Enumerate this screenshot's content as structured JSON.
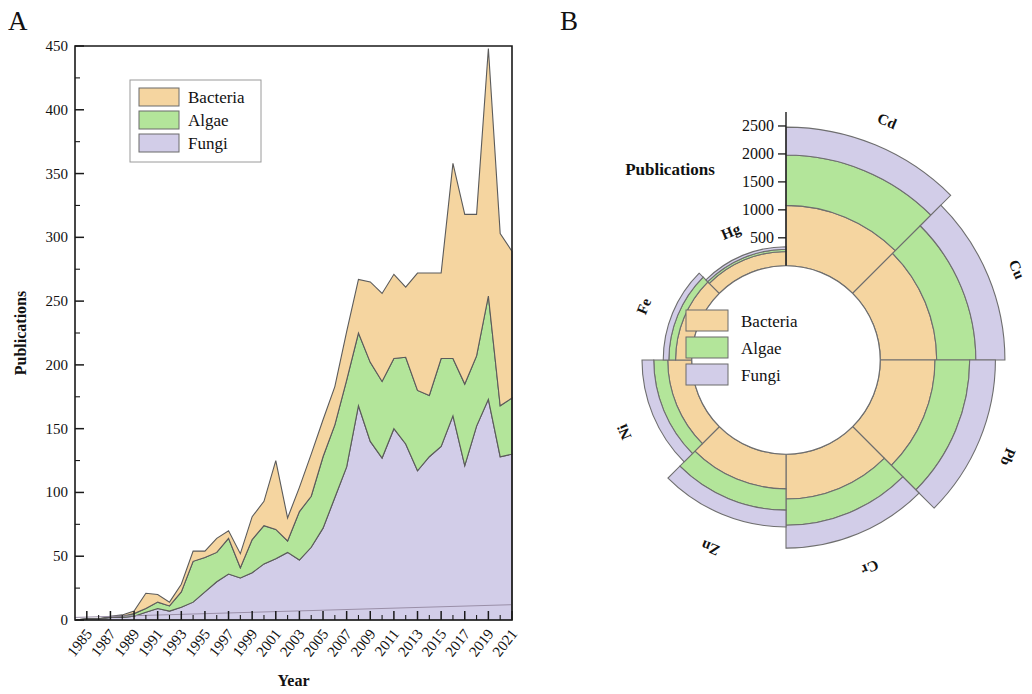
{
  "figure": {
    "panel_a_letter": "A",
    "panel_b_letter": "B"
  },
  "series_colors": {
    "bacteria": "#F5D5A0",
    "algae": "#B3E59A",
    "fungi": "#D2CDE8",
    "outline": "#6e6e6e"
  },
  "legend": {
    "items": [
      {
        "label": "Bacteria",
        "color": "#F5D5A0"
      },
      {
        "label": "Algae",
        "color": "#B3E59A"
      },
      {
        "label": "Fungi",
        "color": "#D2CDE8"
      }
    ]
  },
  "chart_data": [
    {
      "id": "panel-a",
      "type": "area",
      "stacked": true,
      "title": "",
      "xlabel": "Year",
      "ylabel": "Publications",
      "xlim": [
        1984,
        2021
      ],
      "ylim": [
        0,
        450
      ],
      "ytick_step": 50,
      "yminor_step": 25,
      "grid": false,
      "legend_position": "top-left",
      "xticks": [
        1985,
        1987,
        1989,
        1991,
        1993,
        1995,
        1997,
        1999,
        2001,
        2003,
        2005,
        2007,
        2009,
        2011,
        2013,
        2015,
        2017,
        2019,
        2021
      ],
      "yticks": [
        0,
        50,
        100,
        150,
        200,
        250,
        300,
        350,
        400,
        450
      ],
      "x": [
        1984,
        1985,
        1986,
        1987,
        1988,
        1989,
        1990,
        1991,
        1992,
        1993,
        1994,
        1995,
        1996,
        1997,
        1998,
        1999,
        2000,
        2001,
        2002,
        2003,
        2004,
        2005,
        2006,
        2007,
        2008,
        2009,
        2010,
        2011,
        2012,
        2013,
        2014,
        2015,
        2016,
        2017,
        2018,
        2019,
        2020,
        2021
      ],
      "series": [
        {
          "name": "Fungi",
          "color": "#D2CDE8",
          "values": [
            0,
            1,
            1,
            2,
            2,
            3,
            6,
            9,
            7,
            10,
            14,
            22,
            30,
            36,
            33,
            37,
            44,
            48,
            53,
            47,
            57,
            72,
            96,
            120,
            168,
            140,
            127,
            150,
            138,
            117,
            128,
            136,
            160,
            121,
            152,
            173,
            128,
            130
          ]
        },
        {
          "name": "Algae",
          "color": "#B3E59A",
          "values": [
            0,
            0,
            0,
            0,
            1,
            2,
            3,
            5,
            4,
            12,
            32,
            27,
            23,
            28,
            8,
            26,
            30,
            23,
            9,
            38,
            40,
            56,
            57,
            68,
            57,
            62,
            60,
            55,
            68,
            63,
            48,
            69,
            45,
            64,
            55,
            81,
            40,
            44
          ]
        },
        {
          "name": "Bacteria",
          "color": "#F5D5A0",
          "values": [
            0,
            0,
            0,
            1,
            1,
            2,
            12,
            6,
            3,
            6,
            8,
            5,
            11,
            6,
            11,
            18,
            19,
            54,
            18,
            19,
            33,
            29,
            30,
            38,
            42,
            63,
            69,
            66,
            55,
            92,
            96,
            67,
            153,
            133,
            111,
            194,
            135,
            115
          ]
        }
      ],
      "trendline": {
        "name": "baseline",
        "visible": true,
        "x": [
          1984,
          2021
        ],
        "y": [
          2,
          12
        ]
      }
    },
    {
      "id": "panel-b",
      "type": "bar",
      "coordinate": "polar",
      "stacked": true,
      "unit_label": "Publications",
      "rlim": [
        0,
        2750
      ],
      "rticks": [
        500,
        1000,
        1500,
        2000,
        2500
      ],
      "inner_hole_fraction": 0.38,
      "start_angle_deg": 0,
      "direction": "clockwise",
      "categories": [
        "Cd",
        "Cu",
        "Pb",
        "Cr",
        "Zn",
        "Ni",
        "Fe",
        "Hg"
      ],
      "series": [
        {
          "name": "Bacteria",
          "color": "#F5D5A0",
          "values": [
            1080,
            1010,
            980,
            800,
            620,
            430,
            290,
            255
          ]
        },
        {
          "name": "Algae",
          "color": "#B3E59A",
          "values": [
            900,
            700,
            620,
            470,
            380,
            250,
            120,
            40
          ]
        },
        {
          "name": "Fungi",
          "color": "#D2CDE8",
          "values": [
            500,
            520,
            460,
            410,
            300,
            210,
            100,
            45
          ]
        }
      ],
      "totals": [
        2480,
        2230,
        2060,
        1680,
        1300,
        890,
        510,
        340
      ]
    }
  ]
}
